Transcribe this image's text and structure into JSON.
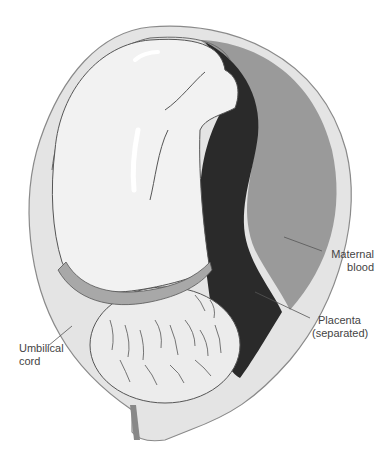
{
  "figure": {
    "colors": {
      "uterine_wall": "#e4e4e4",
      "uterine_outline": "#8a8a8a",
      "fetal_body": "#f2f2f2",
      "placenta_dark": "#2a2a2a",
      "maternal_blood": "#9a9a9a",
      "umbilical_cord": "#a8a8a8",
      "fetal_head": "#ececec",
      "text": "#444444"
    }
  },
  "labels": {
    "maternal_blood": [
      "Maternal",
      "blood"
    ],
    "placenta": [
      "Placenta",
      "(separated)"
    ],
    "umbilical_cord": [
      "Umbilical",
      "cord"
    ]
  }
}
